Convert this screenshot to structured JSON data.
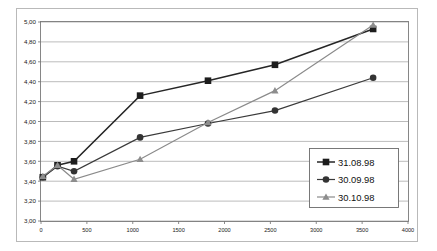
{
  "chart_data": {
    "type": "line",
    "title": "",
    "subtitle": "",
    "xlabel": "",
    "ylabel": "",
    "xlim": [
      0,
      4000
    ],
    "ylim": [
      3.0,
      5.0
    ],
    "xticks": [
      "0",
      "500",
      "1000",
      "1500",
      "2000",
      "2500",
      "3000",
      "3500",
      "4000"
    ],
    "xtick_values": [
      0,
      500,
      1000,
      1500,
      2000,
      2500,
      3000,
      3500,
      4000
    ],
    "yticks": [
      "3,00",
      "3,20",
      "3,40",
      "3,60",
      "3,80",
      "4,00",
      "4,20",
      "4,40",
      "4,60",
      "4,80",
      "5,00"
    ],
    "ytick_values": [
      3.0,
      3.2,
      3.4,
      3.6,
      3.8,
      4.0,
      4.2,
      4.4,
      4.6,
      4.8,
      5.0
    ],
    "grid": "horizontal",
    "legend_position": "inside-right-lower",
    "x": [
      20,
      180,
      360,
      1080,
      1820,
      2550,
      3620
    ],
    "series": [
      {
        "name": "31.08.98",
        "marker": "square",
        "color": "#1d1d1d",
        "values": [
          3.44,
          3.56,
          3.6,
          4.26,
          4.41,
          4.57,
          4.93
        ]
      },
      {
        "name": "30.09.98",
        "marker": "circle",
        "color": "#333333",
        "values": [
          3.44,
          3.55,
          3.5,
          3.84,
          3.98,
          4.11,
          4.44
        ]
      },
      {
        "name": "30.10.98",
        "marker": "triangle",
        "color": "#8d8d8d",
        "values": [
          3.45,
          3.56,
          3.42,
          3.62,
          3.99,
          4.31,
          4.97
        ]
      }
    ],
    "legend": [
      "31.08.98",
      "30.09.98",
      "30.10.98"
    ]
  },
  "colors": {
    "series_1": "#1d1d1d",
    "series_2": "#333333",
    "series_3": "#8d8d8d",
    "grid": "#8d8d8d",
    "frame": "#b9b9b9",
    "plot_border": "#7a7a7a",
    "background": "#ffffff"
  }
}
